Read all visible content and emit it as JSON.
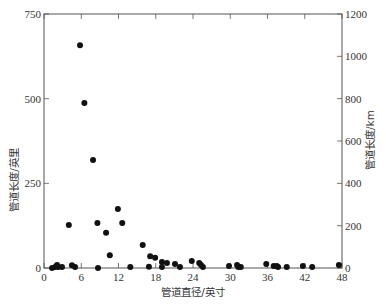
{
  "chart_data": {
    "type": "scatter",
    "title": "",
    "xlabel": "管道直径/英寸",
    "ylabel": "管道长度/英里",
    "y2label": "管道长度/km",
    "xlim": [
      0,
      48
    ],
    "ylim": [
      0,
      750
    ],
    "y2lim": [
      0,
      1200
    ],
    "xticks": [
      0,
      6,
      12,
      18,
      24,
      30,
      36,
      42,
      48
    ],
    "yticks": [
      0,
      250,
      500,
      750
    ],
    "y2ticks": [
      0,
      200,
      400,
      600,
      800,
      1000,
      1200
    ],
    "grid": false,
    "legend": null,
    "marker_color": "#111111",
    "series": [
      {
        "name": "管道长度",
        "points": [
          {
            "x": 1.3,
            "y": 0
          },
          {
            "x": 1.8,
            "y": 3
          },
          {
            "x": 2.1,
            "y": 9
          },
          {
            "x": 2.3,
            "y": 3
          },
          {
            "x": 2.9,
            "y": 3
          },
          {
            "x": 4.0,
            "y": 127
          },
          {
            "x": 4.5,
            "y": 8
          },
          {
            "x": 5.0,
            "y": 3
          },
          {
            "x": 5.8,
            "y": 658
          },
          {
            "x": 6.5,
            "y": 487
          },
          {
            "x": 7.9,
            "y": 319
          },
          {
            "x": 8.6,
            "y": 133
          },
          {
            "x": 8.7,
            "y": 0
          },
          {
            "x": 10.0,
            "y": 104
          },
          {
            "x": 10.6,
            "y": 38
          },
          {
            "x": 11.9,
            "y": 174
          },
          {
            "x": 12.6,
            "y": 133
          },
          {
            "x": 13.9,
            "y": 3
          },
          {
            "x": 15.9,
            "y": 68
          },
          {
            "x": 16.9,
            "y": 4
          },
          {
            "x": 17.1,
            "y": 35
          },
          {
            "x": 17.9,
            "y": 30
          },
          {
            "x": 19.0,
            "y": 18
          },
          {
            "x": 19.0,
            "y": 3
          },
          {
            "x": 19.8,
            "y": 15
          },
          {
            "x": 21.1,
            "y": 12
          },
          {
            "x": 21.9,
            "y": 3
          },
          {
            "x": 23.8,
            "y": 21
          },
          {
            "x": 25.0,
            "y": 15
          },
          {
            "x": 25.3,
            "y": 9
          },
          {
            "x": 25.6,
            "y": 3
          },
          {
            "x": 29.8,
            "y": 6
          },
          {
            "x": 31.1,
            "y": 9
          },
          {
            "x": 31.3,
            "y": 3
          },
          {
            "x": 31.7,
            "y": 3
          },
          {
            "x": 35.8,
            "y": 12
          },
          {
            "x": 37.0,
            "y": 6
          },
          {
            "x": 37.5,
            "y": 6
          },
          {
            "x": 37.7,
            "y": 3
          },
          {
            "x": 39.1,
            "y": 3
          },
          {
            "x": 41.7,
            "y": 6
          },
          {
            "x": 43.2,
            "y": 3
          },
          {
            "x": 47.5,
            "y": 9
          }
        ]
      }
    ]
  },
  "labels": {
    "xlabel": "管道直径/英寸",
    "ylabel": "管道长度/英里",
    "y2label": "管道长度/km"
  }
}
